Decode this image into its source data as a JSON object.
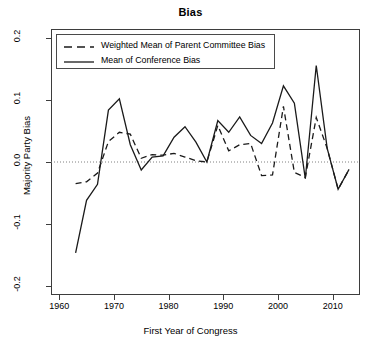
{
  "chart_data": {
    "type": "line",
    "title": "Bias",
    "xlabel": "First Year of Congress",
    "ylabel": "Majority Party Bias",
    "xlim": [
      1958.5,
      1915.5
    ],
    "x_range": [
      1958.5,
      2015.0
    ],
    "ylim": [
      -0.215,
      0.215
    ],
    "xticks": [
      1960,
      1970,
      1980,
      1990,
      2000,
      2010
    ],
    "xticklabels": [
      "1960",
      "1970",
      "1980",
      "1990",
      "2000",
      "2010"
    ],
    "yticks": [
      -0.2,
      -0.1,
      0.0,
      0.1,
      0.2
    ],
    "yticklabels": [
      "-0.2",
      "-0.1",
      "0.0",
      "0.1",
      "0.2"
    ],
    "grid": false,
    "reference_line": {
      "y": 0.0,
      "style": "dotted",
      "color": "#808080"
    },
    "legend_position": "top-left",
    "x": [
      1963,
      1965,
      1967,
      1969,
      1971,
      1973,
      1975,
      1977,
      1979,
      1981,
      1983,
      1985,
      1987,
      1989,
      1991,
      1993,
      1995,
      1997,
      1999,
      2001,
      2003,
      2005,
      2007,
      2009,
      2011,
      2013
    ],
    "series": [
      {
        "name": "Weighted Mean of Parent Committee Bias",
        "style": "dashed",
        "color": "#1a1a1a",
        "values": [
          -0.035,
          -0.032,
          -0.018,
          0.033,
          0.048,
          0.045,
          0.006,
          0.012,
          0.011,
          0.014,
          0.008,
          0.002,
          0.0,
          0.059,
          0.018,
          0.028,
          0.03,
          -0.022,
          -0.021,
          0.09,
          -0.017,
          -0.025,
          0.072,
          0.022,
          -0.044,
          -0.012
        ]
      },
      {
        "name": "Mean of Conference Bias",
        "style": "solid",
        "color": "#1a1a1a",
        "values": [
          -0.147,
          -0.062,
          -0.036,
          0.084,
          0.102,
          0.028,
          -0.013,
          0.008,
          0.01,
          0.04,
          0.057,
          0.032,
          0.0,
          0.067,
          0.048,
          0.073,
          0.043,
          0.03,
          0.063,
          0.123,
          0.095,
          -0.027,
          0.156,
          0.022,
          -0.044,
          -0.012
        ]
      }
    ]
  },
  "legend": {
    "items": [
      {
        "label": "Weighted Mean of Parent Committee Bias",
        "style": "dashed"
      },
      {
        "label": "Mean of Conference Bias",
        "style": "solid"
      }
    ]
  },
  "caption": {
    "partial_text": ""
  }
}
